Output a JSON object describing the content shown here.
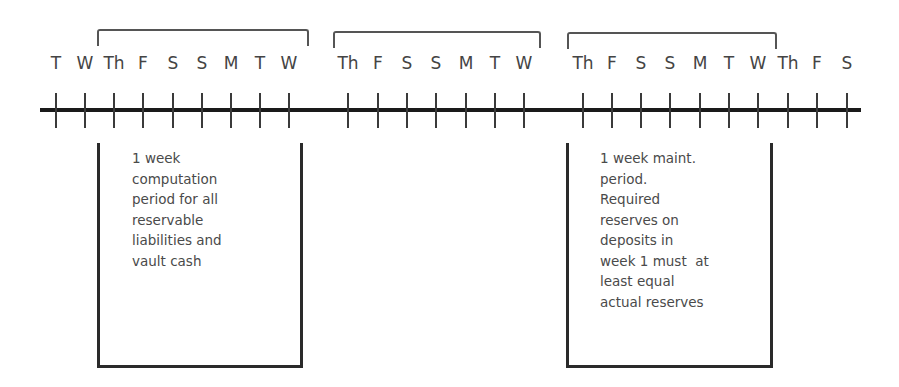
{
  "diagram": {
    "title": "",
    "days": [
      {
        "label": "T",
        "x": 56
      },
      {
        "label": "W",
        "x": 85
      },
      {
        "label": "Th",
        "x": 114
      },
      {
        "label": "F",
        "x": 143
      },
      {
        "label": "S",
        "x": 173
      },
      {
        "label": "S",
        "x": 202
      },
      {
        "label": "M",
        "x": 231
      },
      {
        "label": "T",
        "x": 260
      },
      {
        "label": "W",
        "x": 289
      },
      {
        "label": "Th",
        "x": 348
      },
      {
        "label": "F",
        "x": 378
      },
      {
        "label": "S",
        "x": 407
      },
      {
        "label": "S",
        "x": 436
      },
      {
        "label": "M",
        "x": 466
      },
      {
        "label": "T",
        "x": 495
      },
      {
        "label": "W",
        "x": 524
      },
      {
        "label": "Th",
        "x": 583
      },
      {
        "label": "F",
        "x": 612
      },
      {
        "label": "S",
        "x": 641
      },
      {
        "label": "S",
        "x": 670
      },
      {
        "label": "M",
        "x": 700
      },
      {
        "label": "T",
        "x": 729
      },
      {
        "label": "W",
        "x": 758
      },
      {
        "label": "Th",
        "x": 788
      },
      {
        "label": "F",
        "x": 817
      },
      {
        "label": "S",
        "x": 847
      }
    ],
    "brackets": [
      {
        "name": "week-1-bracket",
        "left": 97,
        "top": 29,
        "width": 208
      },
      {
        "name": "week-2-bracket",
        "left": 333,
        "top": 31,
        "width": 204
      },
      {
        "name": "week-3-bracket",
        "left": 567,
        "top": 32,
        "width": 206
      }
    ],
    "boxes": [
      {
        "name": "computation-period-box",
        "left": 97,
        "top": 143,
        "width": 206,
        "height": 225,
        "text_left": 132,
        "text_top": 148,
        "lines": [
          "1 week",
          "computation",
          "period for all",
          "reservable",
          "liabilities and",
          "vault cash"
        ]
      },
      {
        "name": "maintenance-period-box",
        "left": 566,
        "top": 143,
        "width": 207,
        "height": 225,
        "text_left": 600,
        "text_top": 148,
        "lines": [
          "1 week maint.",
          "period.",
          "Required",
          "reserves on",
          "deposits in",
          "week 1 must  at",
          "least equal",
          "actual reserves"
        ]
      }
    ]
  }
}
